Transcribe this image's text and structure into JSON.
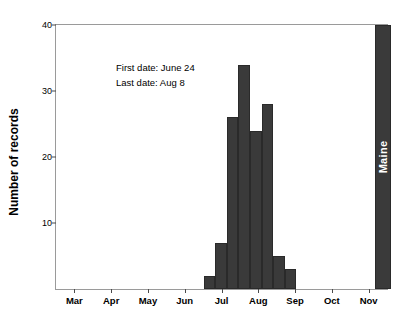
{
  "chart_data": {
    "type": "bar",
    "title": "",
    "xlabel": "",
    "ylabel": "Number of records",
    "ylim": [
      0,
      40
    ],
    "yticks": [
      10,
      20,
      30,
      40
    ],
    "xticks": [
      "Mar",
      "Apr",
      "May",
      "Jun",
      "Jul",
      "Aug",
      "Sep",
      "Oct",
      "Nov"
    ],
    "grid": false,
    "legend": "none",
    "bar_color": "#3a3a3a",
    "categories": [
      "Jun 24",
      "Jul 1",
      "Jul 8",
      "Jul 15",
      "Jul 22",
      "Jul 29",
      "Aug 5",
      "Aug 8"
    ],
    "values": [
      2,
      7,
      26,
      34,
      24,
      28,
      5,
      3
    ],
    "annotations": [
      "First date: June 24",
      "Last date: Aug 8"
    ],
    "region_band": {
      "label": "Maine",
      "position": "Nov"
    }
  },
  "axis": {
    "y_tick_labels": [
      "10",
      "20",
      "30",
      "40"
    ],
    "x_tick_labels": [
      "Mar",
      "Apr",
      "May",
      "Jun",
      "Jul",
      "Aug",
      "Sep",
      "Oct",
      "Nov"
    ]
  }
}
